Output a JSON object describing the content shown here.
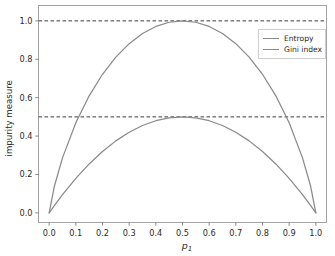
{
  "chart_data": {
    "type": "line",
    "title": "",
    "xlabel": "p1",
    "xlabel_base": "p",
    "xlabel_sub": "1",
    "ylabel": "impurity measure",
    "xlim": [
      -0.04,
      1.04
    ],
    "ylim": [
      -0.05,
      1.08
    ],
    "grid": false,
    "legend_position": "upper right",
    "xticks": [
      "0.0",
      "0.1",
      "0.2",
      "0.3",
      "0.4",
      "0.5",
      "0.6",
      "0.7",
      "0.8",
      "0.9",
      "1.0"
    ],
    "xtick_values": [
      0.0,
      0.1,
      0.2,
      0.3,
      0.4,
      0.5,
      0.6,
      0.7,
      0.8,
      0.9,
      1.0
    ],
    "yticks": [
      "0.0",
      "0.2",
      "0.4",
      "0.6",
      "0.8",
      "1.0"
    ],
    "ytick_values": [
      0.0,
      0.2,
      0.4,
      0.6,
      0.8,
      1.0
    ],
    "reference_lines": [
      {
        "y": 1.0,
        "style": "dashed",
        "color": "#3b3b3b"
      },
      {
        "y": 0.5,
        "style": "dashed",
        "color": "#3b3b3b"
      }
    ],
    "series": [
      {
        "name": "Entropy",
        "color": "#8a8a8a",
        "x": [
          0.0,
          0.02,
          0.05,
          0.1,
          0.15,
          0.2,
          0.25,
          0.3,
          0.35,
          0.4,
          0.45,
          0.5,
          0.55,
          0.6,
          0.65,
          0.7,
          0.75,
          0.8,
          0.85,
          0.9,
          0.95,
          0.98,
          1.0
        ],
        "values": [
          0.0,
          0.1414,
          0.2864,
          0.469,
          0.6098,
          0.7219,
          0.8113,
          0.8813,
          0.9341,
          0.971,
          0.9928,
          1.0,
          0.9928,
          0.971,
          0.9341,
          0.8813,
          0.8113,
          0.7219,
          0.6098,
          0.469,
          0.2864,
          0.1414,
          0.0
        ]
      },
      {
        "name": "Gini index",
        "color": "#8a8a8a",
        "x": [
          0.0,
          0.02,
          0.05,
          0.1,
          0.15,
          0.2,
          0.25,
          0.3,
          0.35,
          0.4,
          0.45,
          0.5,
          0.55,
          0.6,
          0.65,
          0.7,
          0.75,
          0.8,
          0.85,
          0.9,
          0.95,
          0.98,
          1.0
        ],
        "values": [
          0.0,
          0.0392,
          0.095,
          0.18,
          0.255,
          0.32,
          0.375,
          0.42,
          0.455,
          0.48,
          0.495,
          0.5,
          0.495,
          0.48,
          0.455,
          0.42,
          0.375,
          0.32,
          0.255,
          0.18,
          0.095,
          0.0392,
          0.0
        ]
      }
    ]
  },
  "axes": {
    "spine_color": "#9a9a9a",
    "tick_color": "#7a7a7a",
    "background": "#ffffff"
  },
  "legend": {
    "entries": [
      {
        "label": "Entropy"
      },
      {
        "label": "Gini index"
      }
    ]
  }
}
